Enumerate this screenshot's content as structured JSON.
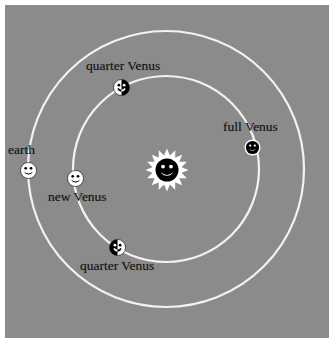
{
  "figure": {
    "kind": "astronomy-diagram",
    "background_color": "#8b8b8b",
    "orbit_color": "#f2f2f2",
    "label_color": "#121212",
    "margin_color": "#ffffff"
  },
  "sun": {
    "name": "sun",
    "icon": "sun-smiley-icon",
    "cx": 167,
    "cy": 170,
    "radius": 22,
    "face_color": "#000000",
    "ray_color": "#ffffff"
  },
  "orbits": [
    {
      "name": "venus-orbit",
      "label": "Venus orbit",
      "cx": 166,
      "cy": 169,
      "r": 93
    },
    {
      "name": "earth-orbit",
      "label": "Earth orbit",
      "cx": 166,
      "cy": 169,
      "r": 138
    }
  ],
  "bodies": [
    {
      "id": "earth",
      "label": "earth",
      "icon": "earth-smiley-icon",
      "phase": "full",
      "orbit": "earth-orbit",
      "cx": 28,
      "cy": 170,
      "radius": 8.5,
      "label_x": 8,
      "label_y": 143
    },
    {
      "id": "venus-quarter-top",
      "label": "quarter Venus",
      "icon": "venus-quarter-icon",
      "phase": "quarter",
      "orbit": "venus-orbit",
      "cx": 121,
      "cy": 87,
      "radius": 8.5,
      "label_x": 86,
      "label_y": 59
    },
    {
      "id": "venus-full",
      "label": "full Venus",
      "icon": "venus-full-icon",
      "phase": "full",
      "orbit": "venus-orbit",
      "cx": 252,
      "cy": 147,
      "radius": 8.5,
      "label_x": 223,
      "label_y": 120
    },
    {
      "id": "venus-new",
      "label": "new Venus",
      "icon": "venus-new-icon",
      "phase": "new",
      "orbit": "venus-orbit",
      "cx": 75,
      "cy": 178,
      "radius": 8.5,
      "label_x": 48,
      "label_y": 190
    },
    {
      "id": "venus-quarter-bottom",
      "label": "quarter Venus",
      "icon": "venus-quarter-icon",
      "phase": "quarter",
      "orbit": "venus-orbit",
      "cx": 117,
      "cy": 247,
      "radius": 8.5,
      "label_x": 80,
      "label_y": 259
    }
  ]
}
